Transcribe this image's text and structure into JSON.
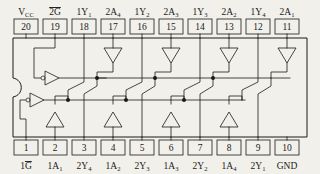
{
  "diagram": {
    "package": "DIP-20",
    "pin_count": 20,
    "background_color": "#f2f0ea",
    "line_color": "#1a1a1a"
  },
  "top_pins": [
    {
      "number": "20",
      "label": "V",
      "sub": "CC",
      "overline": false,
      "x": 26
    },
    {
      "number": "19",
      "label": "2G",
      "sub": "",
      "overline": true,
      "x": 55
    },
    {
      "number": "18",
      "label": "1Y",
      "sub": "1",
      "overline": false,
      "x": 84
    },
    {
      "number": "17",
      "label": "2A",
      "sub": "4",
      "overline": false,
      "x": 113
    },
    {
      "number": "16",
      "label": "1Y",
      "sub": "2",
      "overline": false,
      "x": 142
    },
    {
      "number": "15",
      "label": "2A",
      "sub": "3",
      "overline": false,
      "x": 171
    },
    {
      "number": "14",
      "label": "1Y",
      "sub": "3",
      "overline": false,
      "x": 200
    },
    {
      "number": "13",
      "label": "2A",
      "sub": "2",
      "overline": false,
      "x": 229
    },
    {
      "number": "12",
      "label": "1Y",
      "sub": "4",
      "overline": false,
      "x": 258
    },
    {
      "number": "11",
      "label": "2A",
      "sub": "1",
      "overline": false,
      "x": 287
    }
  ],
  "bottom_pins": [
    {
      "number": "1",
      "label": "1G",
      "sub": "",
      "overline": true,
      "x": 26
    },
    {
      "number": "2",
      "label": "1A",
      "sub": "1",
      "overline": false,
      "x": 55
    },
    {
      "number": "3",
      "label": "2Y",
      "sub": "4",
      "overline": false,
      "x": 84
    },
    {
      "number": "4",
      "label": "1A",
      "sub": "2",
      "overline": false,
      "x": 113
    },
    {
      "number": "5",
      "label": "2Y",
      "sub": "3",
      "overline": false,
      "x": 142
    },
    {
      "number": "6",
      "label": "1A",
      "sub": "3",
      "overline": false,
      "x": 171
    },
    {
      "number": "7",
      "label": "2Y",
      "sub": "2",
      "overline": false,
      "x": 200
    },
    {
      "number": "8",
      "label": "1A",
      "sub": "4",
      "overline": false,
      "x": 229
    },
    {
      "number": "9",
      "label": "2Y",
      "sub": "1",
      "overline": false,
      "x": 258
    },
    {
      "number": "10",
      "label": "GND",
      "sub": "",
      "overline": false,
      "x": 287
    }
  ],
  "gates": {
    "enable_inverters": [
      {
        "name": "2G-enable-inverter",
        "x": 47,
        "y": 78
      },
      {
        "name": "1G-enable-inverter",
        "x": 32,
        "y": 100
      }
    ],
    "top_buffers": [
      {
        "name": "buffer-2A4",
        "x": 118,
        "y": 55
      },
      {
        "name": "buffer-2A3",
        "x": 176,
        "y": 55
      },
      {
        "name": "buffer-2A2",
        "x": 234,
        "y": 55
      },
      {
        "name": "buffer-2A1",
        "x": 292,
        "y": 55
      }
    ],
    "bottom_buffers": [
      {
        "name": "buffer-1A1",
        "x": 60,
        "y": 112
      },
      {
        "name": "buffer-1A2",
        "x": 118,
        "y": 112
      },
      {
        "name": "buffer-1A3",
        "x": 176,
        "y": 112
      },
      {
        "name": "buffer-1A4",
        "x": 234,
        "y": 112
      }
    ]
  }
}
